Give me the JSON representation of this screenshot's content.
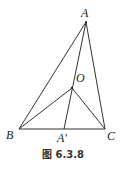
{
  "figure": {
    "caption": "图 6.3.8",
    "points": {
      "A": "A",
      "B": "B",
      "C": "C",
      "O": "O",
      "A_prime": "A'"
    },
    "segments": [
      "AB",
      "AC",
      "BC",
      "AA'",
      "OB",
      "OC"
    ]
  }
}
